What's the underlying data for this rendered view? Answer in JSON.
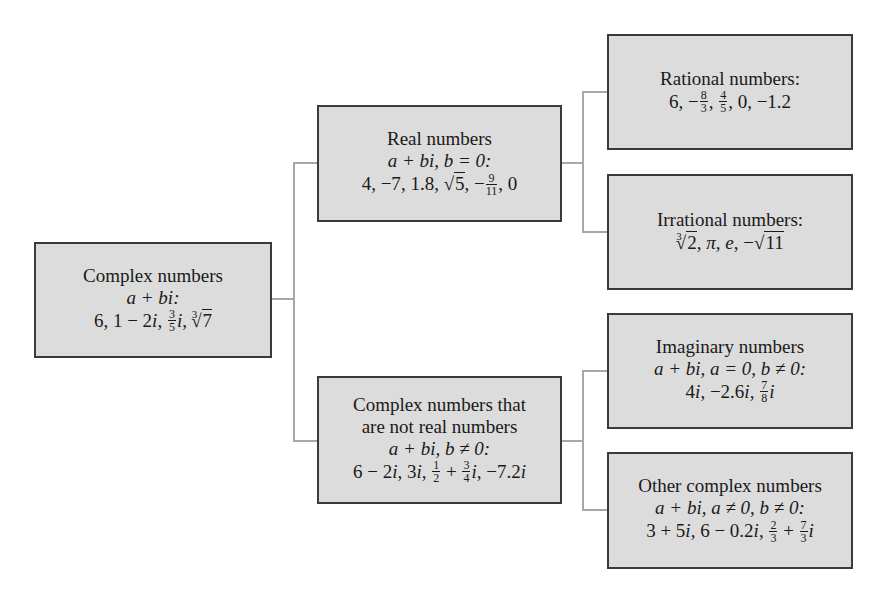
{
  "diagram": {
    "colors": {
      "box_fill": "#dcdcdc",
      "box_border": "#3a3a3a",
      "connector": "#a8a8a8",
      "background": "#ffffff"
    },
    "nodes": {
      "complex": {
        "title": "Complex numbers",
        "formula": "a + bi:",
        "examples_text": "6, 1 − 2i, 3/5 i, ∛7"
      },
      "real": {
        "title": "Real numbers",
        "formula": "a + bi, b = 0:",
        "examples_text": "4, −7, 1.8, √5, −9/11, 0"
      },
      "nonreal": {
        "title_line1": "Complex numbers that",
        "title_line2": "are not real numbers",
        "formula": "a + bi, b ≠ 0:",
        "examples_text": "6 − 2i, 3i, 1/2 + 3/4 i, −7.2i"
      },
      "rational": {
        "title": "Rational numbers:",
        "examples_text": "6, −8/3, 4/5, 0, −1.2"
      },
      "irrational": {
        "title": "Irrational numbers:",
        "examples_text": "∛2, π, e, −√11"
      },
      "imaginary": {
        "title": "Imaginary numbers",
        "formula": "a + bi, a = 0, b ≠ 0:",
        "examples_text": "4i, −2.6i, 7/8 i"
      },
      "other": {
        "title": "Other complex numbers",
        "formula": "a + bi, a ≠ 0, b ≠ 0:",
        "examples_text": "3 + 5i, 6 − 0.2i, 2/3 + 7/3 i"
      }
    },
    "edges": [
      [
        "complex",
        "real"
      ],
      [
        "complex",
        "nonreal"
      ],
      [
        "real",
        "rational"
      ],
      [
        "real",
        "irrational"
      ],
      [
        "nonreal",
        "imaginary"
      ],
      [
        "nonreal",
        "other"
      ]
    ],
    "glyphs": {
      "comma": ",",
      "comma_sp": ", ",
      "minus": "−",
      "plus": " + ",
      "minus_sp": " − ",
      "root": "√",
      "idx3": "3",
      "i": "i",
      "pi": "π",
      "e": "e",
      "n0": "0",
      "n1": "1",
      "n2": "2",
      "n3": "3",
      "n4": "4",
      "n5": "5",
      "n6": "6",
      "n7": "7",
      "n8": "8",
      "n9": "9",
      "n11": "11",
      "n1_8": "1.8",
      "n1_2": "1.2",
      "n_minus7": "−7",
      "n6i": "6 − 2",
      "n3i": "3",
      "n7_2": "−7.2",
      "n4i": "4",
      "n2_6": "−2.6",
      "n3p5": "3 + 5",
      "n6m02": "6 − 0.2",
      "n1m2": "1 − 2"
    }
  }
}
